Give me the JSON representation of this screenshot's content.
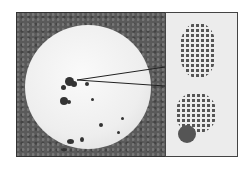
{
  "figure": {
    "colors": {
      "background": "#ffffff",
      "frame": "#5a5a5a",
      "plate": "#f0f0f0",
      "colonies": "#333333",
      "inset": "#ececec"
    }
  }
}
